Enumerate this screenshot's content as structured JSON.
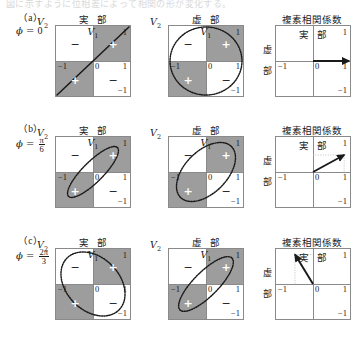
{
  "page": {
    "cutoff_text": "図に示すように位相差によって相関の形が変化する。",
    "column_titles": {
      "real": "実 部",
      "imag": "虚 部",
      "corr": "複素相関係数"
    },
    "axis_labels": {
      "x_v1": "V",
      "x_v1_sub": "1",
      "y_v2": "V",
      "y_v2_sub": "2",
      "corr_x": "実 部",
      "corr_y_char1": "虚",
      "corr_y_char2": "部"
    },
    "ticks": {
      "one": "1",
      "minus_one": "−1",
      "zero": "0"
    },
    "signs": {
      "plus": "+",
      "minus": "−"
    }
  },
  "rows": [
    {
      "tag": "（a）",
      "phi_symbol": "ϕ =",
      "phi_value_type": "integer",
      "phi_integer": "0",
      "phi_numerator": "",
      "phi_denominator": "",
      "phi_text": "ϕ = 0",
      "phi_radians": 0,
      "real_panel": {
        "shape": "line",
        "description": "straight diagonal line y = x",
        "shaded_quadrants": [
          "upper-right",
          "lower-left"
        ],
        "signs": {
          "upper_left": "−",
          "upper_right": "+",
          "lower_left": "+",
          "lower_right": "−"
        }
      },
      "imag_panel": {
        "shape": "circle",
        "description": "dotted unit circle",
        "shaded_quadrants": [
          "upper-right",
          "lower-left"
        ],
        "signs": {
          "upper_left": "−",
          "upper_right": "+",
          "lower_left": "+",
          "lower_right": "−"
        }
      },
      "corr_panel": {
        "arrow_x": 1.0,
        "arrow_y": 0.0,
        "angle_deg": 0,
        "guides": false
      }
    },
    {
      "tag": "（b）",
      "phi_symbol": "ϕ =",
      "phi_value_type": "fraction",
      "phi_integer": "",
      "phi_numerator": "π",
      "phi_denominator": "6",
      "phi_text": "ϕ = π/6",
      "phi_radians": 0.5236,
      "real_panel": {
        "shape": "ellipse",
        "description": "narrow ellipse tilted +45 degrees",
        "tilt_deg": 45,
        "rx": 0.96,
        "ry": 0.3,
        "shaded_quadrants": [
          "upper-right",
          "lower-left"
        ],
        "signs": {
          "upper_left": "−",
          "upper_right": "+",
          "lower_left": "+",
          "lower_right": "−"
        }
      },
      "imag_panel": {
        "shape": "ellipse",
        "description": "wide ellipse tilted +45 degrees",
        "tilt_deg": 45,
        "rx": 1.0,
        "ry": 0.62,
        "shaded_quadrants": [
          "upper-right",
          "lower-left"
        ],
        "signs": {
          "upper_left": "−",
          "upper_right": "+",
          "lower_left": "+",
          "lower_right": "−"
        }
      },
      "corr_panel": {
        "arrow_x": 0.866,
        "arrow_y": 0.5,
        "angle_deg": 30,
        "guides": true
      }
    },
    {
      "tag": "（c）",
      "phi_symbol": "ϕ =",
      "phi_value_type": "fraction",
      "phi_integer": "",
      "phi_numerator": "2π",
      "phi_denominator": "3",
      "phi_text": "ϕ = 2π/3",
      "phi_radians": 2.0944,
      "real_panel": {
        "shape": "ellipse",
        "description": "wide ellipse tilted -45 degrees",
        "tilt_deg": -45,
        "rx": 1.02,
        "ry": 0.78,
        "shaded_quadrants": [
          "upper-right",
          "lower-left"
        ],
        "signs": {
          "upper_left": "−",
          "upper_right": "+",
          "lower_left": "+",
          "lower_right": "−"
        }
      },
      "imag_panel": {
        "shape": "ellipse",
        "description": "narrow ellipse tilted +45 degrees",
        "tilt_deg": 45,
        "rx": 1.02,
        "ry": 0.36,
        "shaded_quadrants": [
          "upper-right",
          "lower-left"
        ],
        "signs": {
          "upper_left": "−",
          "upper_right": "+",
          "lower_left": "+",
          "lower_right": "−"
        }
      },
      "corr_panel": {
        "arrow_x": -0.5,
        "arrow_y": 0.866,
        "angle_deg": 120,
        "guides": true
      }
    }
  ],
  "chart_data": {
    "type": "scatter",
    "panels_per_row": [
      "実 部",
      "虚 部",
      "複素相関係数"
    ],
    "xlabel": "V1",
    "ylabel": "V2",
    "xlim": [
      -1,
      1
    ],
    "ylim": [
      -1,
      1
    ],
    "xticks": [
      -1,
      0,
      1
    ],
    "yticks": [
      -1,
      0,
      1
    ],
    "grid": false,
    "legend": "none",
    "series": [
      {
        "name": "(a) phi = 0 : real part",
        "shape": "line",
        "tilt_deg": 45,
        "semi_major": 1.0,
        "semi_minor": 0.0,
        "shaded_quadrants": [
          "upper-right",
          "lower-left"
        ]
      },
      {
        "name": "(a) phi = 0 : imaginary part",
        "shape": "circle",
        "tilt_deg": 0,
        "semi_major": 1.0,
        "semi_minor": 1.0,
        "shaded_quadrants": [
          "upper-right",
          "lower-left"
        ]
      },
      {
        "name": "(a) phi = 0 : complex correlation",
        "shape": "vector",
        "x": 1.0,
        "y": 0.0,
        "magnitude": 1.0,
        "angle_deg": 0
      },
      {
        "name": "(b) phi = pi/6 : real part",
        "shape": "ellipse",
        "tilt_deg": 45,
        "semi_major": 0.96,
        "semi_minor": 0.3,
        "shaded_quadrants": [
          "upper-right",
          "lower-left"
        ]
      },
      {
        "name": "(b) phi = pi/6 : imaginary part",
        "shape": "ellipse",
        "tilt_deg": 45,
        "semi_major": 1.0,
        "semi_minor": 0.62,
        "shaded_quadrants": [
          "upper-right",
          "lower-left"
        ]
      },
      {
        "name": "(b) phi = pi/6 : complex correlation",
        "shape": "vector",
        "x": 0.866,
        "y": 0.5,
        "magnitude": 1.0,
        "angle_deg": 30
      },
      {
        "name": "(c) phi = 2pi/3 : real part",
        "shape": "ellipse",
        "tilt_deg": -45,
        "semi_major": 1.02,
        "semi_minor": 0.78,
        "shaded_quadrants": [
          "upper-right",
          "lower-left"
        ]
      },
      {
        "name": "(c) phi = 2pi/3 : imaginary part",
        "shape": "ellipse",
        "tilt_deg": 45,
        "semi_major": 1.02,
        "semi_minor": 0.36,
        "shaded_quadrants": [
          "upper-right",
          "lower-left"
        ]
      },
      {
        "name": "(c) phi = 2pi/3 : complex correlation",
        "shape": "vector",
        "x": -0.5,
        "y": 0.866,
        "magnitude": 1.0,
        "angle_deg": 120
      }
    ]
  },
  "style": {
    "shade_color": "#9d9d9d",
    "line_color": "#1a1a1a",
    "axis_color": "#8a8a8a",
    "guide_color": "#b9b9b9",
    "background": "#ffffff"
  }
}
